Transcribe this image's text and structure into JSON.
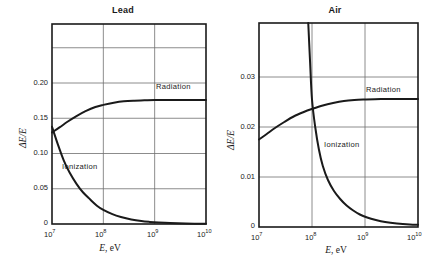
{
  "figure": {
    "background": "#ffffff",
    "ink": "#1a1a1a",
    "grid_color": "#6f6f6f"
  },
  "panels": [
    {
      "id": "lead",
      "title": "Lead",
      "xlabel_sym": "E",
      "xlabel_unit": ", eV",
      "ylabel": "ΔE/E",
      "y_ticks": [
        "0.20",
        "0.15",
        "0.10",
        "0.05",
        "0"
      ],
      "x_ticks": [
        "10",
        "10",
        "10",
        "10"
      ],
      "x_tick_exps": [
        "7",
        "8",
        "9",
        "10"
      ],
      "curve_labels": [
        "Radiation",
        "Ionization"
      ]
    },
    {
      "id": "air",
      "title": "Air",
      "xlabel_sym": "E",
      "xlabel_unit": ", eV",
      "ylabel": "ΔE/E",
      "y_ticks": [
        "0.03",
        "0.02",
        "0.01",
        "0"
      ],
      "x_ticks": [
        "10",
        "10",
        "10",
        "10"
      ],
      "x_tick_exps": [
        "7",
        "8",
        "9",
        "10"
      ],
      "curve_labels": [
        "Radiation",
        "Ionization"
      ]
    }
  ],
  "chart_data": [
    {
      "type": "line",
      "id": "lead",
      "title": "Lead",
      "xlabel": "E, eV",
      "ylabel": "ΔE/E",
      "xscale": "log",
      "xlim": [
        10000000.0,
        10000000000.0
      ],
      "ylim": [
        0,
        0.2837
      ],
      "xticks": [
        10000000.0,
        100000000.0,
        1000000000.0,
        10000000000.0
      ],
      "xticklabels": [
        "10^7",
        "10^8",
        "10^9",
        "10^10"
      ],
      "yticks": [
        0,
        0.05,
        0.1,
        0.15,
        0.2
      ],
      "yticklabels": [
        "0",
        "0.05",
        "0.10",
        "0.15",
        "0.20"
      ],
      "grid": true,
      "grid_x": [
        100000000.0,
        1000000000.0
      ],
      "grid_y": [
        0.05,
        0.1,
        0.15,
        0.2,
        0.25
      ],
      "series": [
        {
          "name": "Radiation",
          "label_position": "inside-right",
          "x": [
            10000000.0,
            14000000.0,
            20000000.0,
            30000000.0,
            45000000.0,
            70000000.0,
            100000000.0,
            160000000.0,
            250000000.0,
            400000000.0,
            630000000.0,
            1000000000.0,
            2000000000.0,
            4000000000.0,
            10000000000.0
          ],
          "y": [
            0.13,
            0.137,
            0.145,
            0.153,
            0.16,
            0.166,
            0.169,
            0.172,
            0.174,
            0.175,
            0.1755,
            0.176,
            0.176,
            0.176,
            0.176
          ]
        },
        {
          "name": "Ionization",
          "label_position": "inside-left",
          "x": [
            10000000.0,
            13000000.0,
            17000000.0,
            22000000.0,
            30000000.0,
            40000000.0,
            55000000.0,
            75000000.0,
            100000000.0,
            150000000.0,
            220000000.0,
            350000000.0,
            550000000.0,
            800000000.0,
            1200000000.0,
            2000000000.0,
            4000000000.0,
            10000000000.0
          ],
          "y": [
            0.138,
            0.113,
            0.09,
            0.073,
            0.057,
            0.045,
            0.035,
            0.026,
            0.02,
            0.014,
            0.01,
            0.0065,
            0.0042,
            0.003,
            0.0021,
            0.0013,
            0.0007,
            0.0003
          ]
        }
      ]
    },
    {
      "type": "line",
      "id": "air",
      "title": "Air",
      "xlabel": "E, eV",
      "ylabel": "ΔE/E",
      "xscale": "log",
      "xlim": [
        10000000.0,
        10000000000.0
      ],
      "ylim": [
        0,
        0.0408
      ],
      "xticks": [
        10000000.0,
        100000000.0,
        1000000000.0,
        10000000000.0
      ],
      "xticklabels": [
        "10^7",
        "10^8",
        "10^9",
        "10^10"
      ],
      "yticks": [
        0,
        0.01,
        0.02,
        0.03
      ],
      "yticklabels": [
        "0",
        "0.01",
        "0.02",
        "0.03"
      ],
      "grid": true,
      "grid_x": [
        100000000.0,
        1000000000.0
      ],
      "grid_y": [
        0.01,
        0.02,
        0.03
      ],
      "series": [
        {
          "name": "Radiation",
          "label_position": "inside-right",
          "x": [
            10000000.0,
            14000000.0,
            20000000.0,
            30000000.0,
            45000000.0,
            70000000.0,
            100000000.0,
            160000000.0,
            250000000.0,
            400000000.0,
            630000000.0,
            1000000000.0,
            2000000000.0,
            4000000000.0,
            10000000000.0
          ],
          "y": [
            0.0175,
            0.0186,
            0.0198,
            0.021,
            0.0221,
            0.023,
            0.0236,
            0.0243,
            0.0248,
            0.0252,
            0.0254,
            0.0255,
            0.0256,
            0.0256,
            0.0256
          ]
        },
        {
          "name": "Ionization",
          "label_position": "inside-center",
          "x": [
            85000000.0,
            92000000.0,
            100000000.0,
            115000000.0,
            135000000.0,
            160000000.0,
            200000000.0,
            260000000.0,
            340000000.0,
            450000000.0,
            600000000.0,
            800000000.0,
            1100000000.0,
            1600000000.0,
            2400000000.0,
            4000000000.0,
            7000000000.0,
            10000000000.0
          ],
          "y": [
            0.0408,
            0.033,
            0.0255,
            0.02,
            0.0155,
            0.0122,
            0.0094,
            0.0072,
            0.0056,
            0.0043,
            0.0033,
            0.0025,
            0.0019,
            0.0014,
            0.001,
            0.0007,
            0.0005,
            0.00045
          ]
        }
      ]
    }
  ]
}
